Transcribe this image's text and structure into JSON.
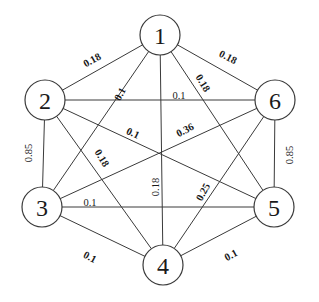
{
  "diagram": {
    "type": "weighted-complete-graph",
    "node_radius": 20,
    "nodes": [
      {
        "id": "1",
        "label": "1",
        "x": 160,
        "y": 35
      },
      {
        "id": "2",
        "label": "2",
        "x": 45,
        "y": 100
      },
      {
        "id": "3",
        "label": "3",
        "x": 42,
        "y": 207
      },
      {
        "id": "4",
        "label": "4",
        "x": 163,
        "y": 265
      },
      {
        "id": "5",
        "label": "5",
        "x": 274,
        "y": 207
      },
      {
        "id": "6",
        "label": "6",
        "x": 275,
        "y": 100
      }
    ],
    "edges": [
      {
        "from": "1",
        "to": "2",
        "weight": "0.18",
        "lx": 92,
        "ly": 60,
        "angle": -29,
        "bold": true
      },
      {
        "from": "1",
        "to": "6",
        "weight": "0.18",
        "lx": 228,
        "ly": 57,
        "angle": 27,
        "bold": true
      },
      {
        "from": "1",
        "to": "3",
        "weight": "0.1",
        "lx": 120,
        "ly": 94,
        "angle": -62,
        "bold": true
      },
      {
        "from": "1",
        "to": "5",
        "weight": "0.18",
        "lx": 203,
        "ly": 83,
        "angle": 58,
        "bold": true
      },
      {
        "from": "1",
        "to": "4",
        "weight": "0.18",
        "lx": 155,
        "ly": 187,
        "angle": -90,
        "bold": false
      },
      {
        "from": "2",
        "to": "6",
        "weight": "0.1",
        "lx": 179,
        "ly": 95,
        "angle": 0,
        "bold": false
      },
      {
        "from": "2",
        "to": "5",
        "weight": "0.1",
        "lx": 133,
        "ly": 133,
        "angle": 25,
        "bold": true
      },
      {
        "from": "2",
        "to": "4",
        "weight": "0.18",
        "lx": 102,
        "ly": 158,
        "angle": 58,
        "bold": true
      },
      {
        "from": "2",
        "to": "3",
        "weight": "0.85",
        "lx": 28,
        "ly": 153,
        "angle": -90,
        "bold": false
      },
      {
        "from": "3",
        "to": "6",
        "weight": "0.36",
        "lx": 185,
        "ly": 130,
        "angle": -27,
        "bold": true
      },
      {
        "from": "3",
        "to": "5",
        "weight": "0.1",
        "lx": 90,
        "ly": 202,
        "angle": 0,
        "bold": false
      },
      {
        "from": "3",
        "to": "4",
        "weight": "0.1",
        "lx": 90,
        "ly": 257,
        "angle": 28,
        "bold": true
      },
      {
        "from": "6",
        "to": "4",
        "weight": "0.25",
        "lx": 203,
        "ly": 192,
        "angle": -62,
        "bold": true
      },
      {
        "from": "6",
        "to": "5",
        "weight": "0.85",
        "lx": 289,
        "ly": 155,
        "angle": -90,
        "bold": false
      },
      {
        "from": "4",
        "to": "5",
        "weight": "0.1",
        "lx": 231,
        "ly": 255,
        "angle": -28,
        "bold": true
      }
    ],
    "colors": {
      "stroke": "#3a3a3a",
      "text": "#1a1a1a",
      "background": "#ffffff"
    }
  }
}
